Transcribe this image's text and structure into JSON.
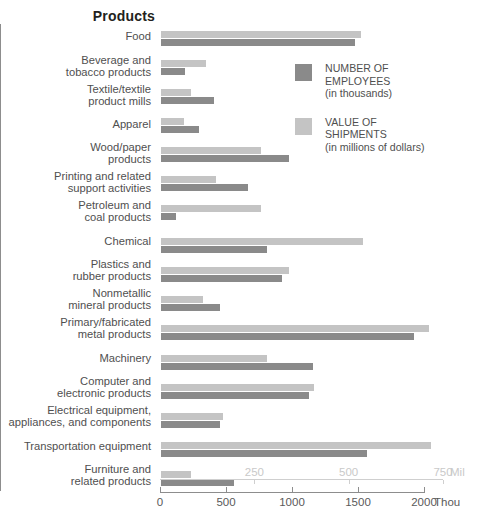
{
  "header": {
    "title": "Products"
  },
  "legend": {
    "position": "inside-top-right",
    "items": [
      {
        "swatch": "dark",
        "color": "#8a8a8a",
        "label": "NUMBER OF\nEMPLOYEES\n(in thousands)"
      },
      {
        "swatch": "light",
        "color": "#c4c4c4",
        "label": "VALUE OF\nSHIPMENTS\n(in millions of dollars)"
      }
    ]
  },
  "axes": {
    "thou": {
      "unit": "Thou",
      "ticks": [
        "0",
        "500",
        "1000",
        "1500",
        "2000"
      ],
      "values": [
        0,
        500,
        1000,
        1500,
        2000
      ],
      "color": "#5a5a5a"
    },
    "mil": {
      "unit": "Mil",
      "ticks": [
        "250",
        "500",
        "750"
      ],
      "values": [
        250,
        500,
        750
      ],
      "color": "#c9c9c9"
    }
  },
  "chart_data": {
    "type": "bar",
    "title": "Products",
    "orientation": "horizontal",
    "xlabel": "",
    "ylabel": "Products",
    "grid": false,
    "legend_position": "inside-top-right",
    "categories": [
      "Food",
      "Beverage and\ntobacco products",
      "Textile/textile\nproduct mills",
      "Apparel",
      "Wood/paper\nproducts",
      "Printing and related\nsupport activities",
      "Petroleum and\ncoal products",
      "Chemical",
      "Plastics and\nrubber products",
      "Nonmetallic\nmineral products",
      "Primary/fabricated\nmetal products",
      "Machinery",
      "Computer and\nelectronic products",
      "Electrical equipment,\nappliances, and components",
      "Transportation equipment",
      "Furniture and\nrelated products"
    ],
    "series": [
      {
        "name": "VALUE OF SHIPMENTS",
        "unit": "millions of dollars",
        "axis": "mil",
        "color": "#c4c4c4",
        "values": [
          530,
          118,
          80,
          62,
          265,
          145,
          265,
          535,
          340,
          110,
          710,
          280,
          405,
          165,
          715,
          80
        ]
      },
      {
        "name": "NUMBER OF EMPLOYEES",
        "unit": "thousands",
        "axis": "thou",
        "color": "#8a8a8a",
        "values": [
          1470,
          180,
          400,
          290,
          970,
          660,
          110,
          800,
          920,
          450,
          1920,
          1150,
          1120,
          450,
          1560,
          550
        ]
      }
    ],
    "xlim_thou": [
      0,
      2000
    ],
    "xlim_mil": [
      0,
      750
    ]
  }
}
